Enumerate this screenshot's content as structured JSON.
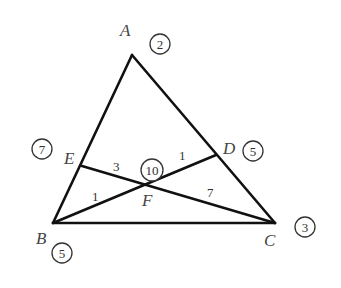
{
  "diagram": {
    "type": "triangle-cevians-mass-points",
    "vertices": {
      "A": {
        "label": "A",
        "mass": "2",
        "x": 132,
        "y": 55,
        "lx": 120,
        "ly": 36,
        "cx": 160,
        "cy": 44
      },
      "B": {
        "label": "B",
        "mass": "5",
        "x": 53,
        "y": 223,
        "lx": 36,
        "ly": 244,
        "cx": 62,
        "cy": 253
      },
      "C": {
        "label": "C",
        "mass": "3",
        "x": 275,
        "y": 223,
        "lx": 264,
        "ly": 246,
        "cx": 305,
        "cy": 227
      },
      "D": {
        "label": "D",
        "mass": "5",
        "x": 216,
        "y": 155,
        "lx": 223,
        "ly": 154,
        "cx": 253,
        "cy": 151
      },
      "E": {
        "label": "E",
        "mass": "7",
        "x": 82,
        "y": 166,
        "lx": 64,
        "ly": 164,
        "cx": 42,
        "cy": 149
      },
      "F": {
        "label": "F",
        "mass": "10",
        "x": 151,
        "y": 184,
        "lx": 142,
        "ly": 206,
        "cx": 152,
        "cy": 170
      }
    },
    "segment_labels": [
      {
        "text": "3",
        "segment": "EF",
        "x": 117,
        "y": 171
      },
      {
        "text": "1",
        "segment": "FB",
        "x": 96,
        "y": 201
      },
      {
        "text": "1",
        "segment": "FD",
        "x": 183,
        "y": 160
      },
      {
        "text": "7",
        "segment": "FC",
        "x": 211,
        "y": 197
      }
    ],
    "colors": {
      "line": "#111111",
      "text": "#444444"
    }
  }
}
